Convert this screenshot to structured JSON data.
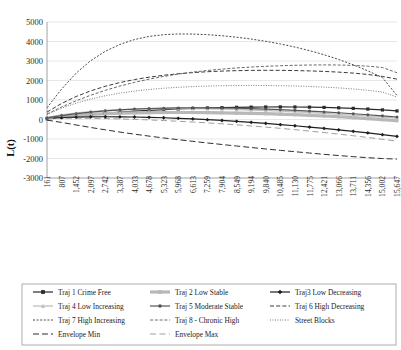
{
  "chart_data": {
    "type": "line",
    "title": "",
    "xlabel": "",
    "ylabel": "L(t)",
    "ylim": [
      -3000,
      5000
    ],
    "ytick_step": 1000,
    "yticks": [
      "5000",
      "4000",
      "3000",
      "2000",
      "1000",
      "0",
      "-1000",
      "-2000",
      "-3000"
    ],
    "grid": true,
    "legend_position": "bottom",
    "x_tick_labels": [
      "161",
      "807",
      "1,452",
      "2,097",
      "2,742",
      "3,387",
      "4,033",
      "4,678",
      "5,323",
      "5,968",
      "6,613",
      "7,259",
      "7,904",
      "8,549",
      "9,194",
      "9,840",
      "10,485",
      "11,130",
      "11,775",
      "12,421",
      "13,066",
      "13,711",
      "14,356",
      "15,002",
      "15,647"
    ],
    "x_axis_range": [
      161,
      15647
    ],
    "x_tick_rotation": -90,
    "series": [
      {
        "name": "Traj 1 Crime Free",
        "style": "solid-marker-square",
        "color": "#2a2a2a",
        "marker": "square",
        "values": [
          40,
          120,
          195,
          260,
          320,
          375,
          425,
          468,
          505,
          538,
          566,
          590,
          609,
          624,
          635,
          642,
          645,
          642,
          634,
          620,
          600,
          572,
          536,
          492,
          438
        ]
      },
      {
        "name": "Traj 2 Low Stable",
        "style": "solid-thick-marker",
        "color": "#b8b8b8",
        "marker": "square",
        "values": [
          60,
          150,
          215,
          265,
          300,
          325,
          342,
          352,
          358,
          360,
          358,
          352,
          344,
          332,
          316,
          297,
          274,
          247,
          215,
          180,
          140,
          96,
          48,
          -4,
          -60
        ]
      },
      {
        "name": "Traj3 Low Decreasing",
        "style": "solid-marker-diamond",
        "color": "#1f1f1f",
        "marker": "diamond",
        "values": [
          55,
          95,
          120,
          135,
          140,
          138,
          128,
          112,
          90,
          62,
          30,
          -8,
          -50,
          -96,
          -146,
          -200,
          -258,
          -320,
          -386,
          -456,
          -530,
          -608,
          -690,
          -776,
          -866
        ]
      },
      {
        "name": "Traj 4 Low Increasing",
        "style": "solid-light-marker-triangle",
        "color": "#c2c2c2",
        "marker": "triangle",
        "values": [
          100,
          230,
          330,
          405,
          462,
          503,
          532,
          550,
          560,
          562,
          558,
          548,
          533,
          513,
          489,
          461,
          429,
          394,
          356,
          315,
          271,
          225,
          176,
          125,
          72
        ]
      },
      {
        "name": "Traj 5 Moderate Stable",
        "style": "solid-marker-circle",
        "color": "#555555",
        "marker": "circle",
        "values": [
          80,
          200,
          300,
          380,
          445,
          495,
          535,
          563,
          583,
          595,
          600,
          598,
          590,
          576,
          557,
          533,
          504,
          471,
          433,
          391,
          345,
          296,
          243,
          187,
          128
        ]
      },
      {
        "name": "Traj 6 High Decreasing",
        "style": "dashed-long",
        "color": "#3a3a3a",
        "marker": "none",
        "values": [
          380,
          820,
          1180,
          1470,
          1705,
          1895,
          2048,
          2170,
          2268,
          2345,
          2405,
          2450,
          2483,
          2505,
          2518,
          2523,
          2520,
          2510,
          2492,
          2466,
          2430,
          2380,
          2310,
          2210,
          2070
        ]
      },
      {
        "name": "Traj 7 High Increasing",
        "style": "dashed-short",
        "color": "#4a4a4a",
        "marker": "none",
        "values": [
          600,
          1560,
          2380,
          3020,
          3500,
          3850,
          4100,
          4260,
          4350,
          4385,
          4382,
          4350,
          4295,
          4220,
          4125,
          4010,
          3875,
          3715,
          3530,
          3320,
          3080,
          2805,
          2495,
          2150,
          1230
        ]
      },
      {
        "name": "Traj 8 - Chronic High",
        "style": "dashed-medium",
        "color": "#6a6a6a",
        "marker": "none",
        "values": [
          280,
          640,
          960,
          1245,
          1495,
          1715,
          1905,
          2070,
          2210,
          2330,
          2430,
          2515,
          2585,
          2643,
          2690,
          2728,
          2758,
          2780,
          2795,
          2800,
          2795,
          2775,
          2735,
          2665,
          2400
        ]
      },
      {
        "name": "Street Blocks",
        "style": "dotted",
        "color": "#7a7a7a",
        "marker": "none",
        "values": [
          260,
          580,
          840,
          1050,
          1218,
          1352,
          1458,
          1540,
          1604,
          1652,
          1688,
          1714,
          1732,
          1742,
          1746,
          1743,
          1734,
          1718,
          1694,
          1662,
          1620,
          1566,
          1498,
          1412,
          1150
        ]
      },
      {
        "name": "Envelope Min",
        "style": "dashed-envelope",
        "color": "#2f2f2f",
        "marker": "none",
        "values": [
          -30,
          -150,
          -280,
          -410,
          -530,
          -645,
          -752,
          -852,
          -946,
          -1035,
          -1120,
          -1202,
          -1282,
          -1360,
          -1436,
          -1510,
          -1582,
          -1652,
          -1720,
          -1786,
          -1848,
          -1906,
          -1958,
          -2002,
          -2030
        ]
      },
      {
        "name": "Envelope Max",
        "style": "dashed-envelope-light",
        "color": "#9f9f9f",
        "marker": "none",
        "values": [
          40,
          60,
          65,
          60,
          48,
          30,
          6,
          -22,
          -54,
          -90,
          -130,
          -174,
          -222,
          -274,
          -330,
          -390,
          -454,
          -522,
          -594,
          -670,
          -750,
          -834,
          -922,
          -1014,
          -1110
        ]
      }
    ]
  },
  "legend": {
    "rows": [
      [
        "Traj 1 Crime Free",
        "Traj 2 Low Stable",
        "Traj3 Low Decreasing"
      ],
      [
        "Traj 4 Low Increasing",
        "Traj 5 Moderate Stable",
        "Traj 6 High Decreasing"
      ],
      [
        "Traj 7 High Increasing",
        "Traj 8 - Chronic High",
        "Street Blocks"
      ],
      [
        "Envelope Min",
        "Envelope Max"
      ]
    ]
  }
}
